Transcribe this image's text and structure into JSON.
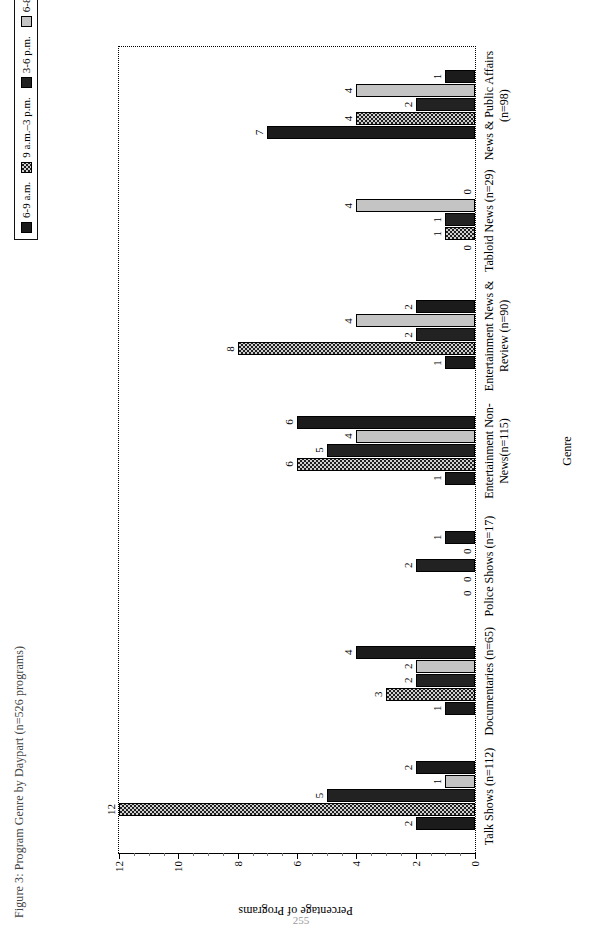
{
  "figure": {
    "title": "Figure 3: Program Genre by Daypart (n=526 programs)",
    "page_number": "255"
  },
  "legend": {
    "position": "top",
    "items": [
      {
        "label": "6-9 a.m.",
        "pattern": "solid-black",
        "color": "#1b1b1b"
      },
      {
        "label": "9 a.m.–3 p.m.",
        "pattern": "checker",
        "color": "#cfcfcf"
      },
      {
        "label": "3-6 p.m.",
        "pattern": "dark",
        "color": "#222222"
      },
      {
        "label": "6-8 p.m.",
        "pattern": "lightgray",
        "color": "#c4c4c4"
      },
      {
        "label": "8-11 p.m.",
        "pattern": "solid-black",
        "color": "#1b1b1b"
      }
    ]
  },
  "axes": {
    "value_axis_title": "Percentage of Programs",
    "category_axis_title": "Genre",
    "value_ticks": [
      "0",
      "2",
      "4",
      "6",
      "8",
      "10",
      "12"
    ]
  },
  "chart_data": {
    "type": "bar",
    "title": "Figure 3: Program Genre by Daypart (n=526 programs)",
    "xlabel": "Genre",
    "ylabel": "Percentage of Programs",
    "ylim": [
      0,
      12
    ],
    "ytick_step": 2,
    "grid": false,
    "legend_position": "top",
    "orientation": "vertical-grouped",
    "categories": [
      "Talk Shows (n=112)",
      "Documentaries (n=65)",
      "Police Shows (n=17)",
      "Entertainment Non-News(n=115)",
      "Entertainment News & Review (n=90)",
      "Tabloid News (n=29)",
      "News & Public Affairs (n=98)"
    ],
    "series": [
      {
        "name": "6-9 a.m.",
        "values": [
          2,
          1,
          0,
          1,
          1,
          0,
          7
        ]
      },
      {
        "name": "9 a.m.–3 p.m.",
        "values": [
          12,
          3,
          0,
          6,
          8,
          1,
          4
        ]
      },
      {
        "name": "3-6 p.m.",
        "values": [
          5,
          2,
          2,
          5,
          2,
          1,
          2
        ]
      },
      {
        "name": "6-8 p.m.",
        "values": [
          1,
          2,
          0,
          4,
          4,
          4,
          4
        ]
      },
      {
        "name": "8-11 p.m.",
        "values": [
          2,
          4,
          1,
          6,
          2,
          0,
          1
        ]
      }
    ]
  }
}
